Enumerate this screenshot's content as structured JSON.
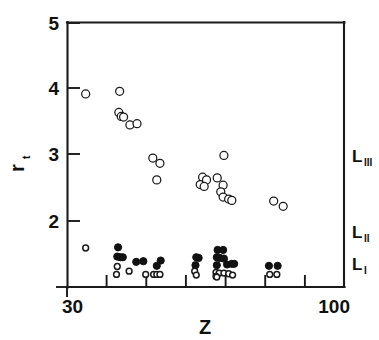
{
  "chart_data": {
    "type": "scatter",
    "title": "",
    "xlabel": "Z",
    "ylabel": "r t",
    "ylabel_base": "r",
    "ylabel_sub": "t",
    "xlim": [
      30,
      100
    ],
    "ylim": [
      1,
      5
    ],
    "grid": false,
    "legend_position": "right-inside",
    "x_tick_labels": [
      "30",
      "100"
    ],
    "x_tick_values": [
      30,
      100
    ],
    "x_minor_ticks": [
      40,
      50,
      60,
      70,
      80,
      90
    ],
    "y_tick_labels": [
      "5",
      "4",
      "3",
      "2",
      "1"
    ],
    "y_tick_values": [
      5,
      4,
      3,
      2,
      1
    ],
    "y_labeled_ticks": [
      "5",
      "4",
      "3",
      "2"
    ],
    "series": [
      {
        "name": "L III",
        "label_base": "L",
        "label_sub": "III",
        "marker": "open-circle",
        "marker_size": 4.0,
        "color": "#1a1a1a",
        "points": [
          [
            34.6,
            3.92
          ],
          [
            43.2,
            3.96
          ],
          [
            43.0,
            3.64
          ],
          [
            43.6,
            3.58
          ],
          [
            44.2,
            3.57
          ],
          [
            45.8,
            3.45
          ],
          [
            47.6,
            3.47
          ],
          [
            51.6,
            2.95
          ],
          [
            53.4,
            2.87
          ],
          [
            52.6,
            2.62
          ],
          [
            64.2,
            2.66
          ],
          [
            63.6,
            2.55
          ],
          [
            65.2,
            2.62
          ],
          [
            64.6,
            2.52
          ],
          [
            69.6,
            2.99
          ],
          [
            67.9,
            2.65
          ],
          [
            69.4,
            2.54
          ],
          [
            68.8,
            2.44
          ],
          [
            69.4,
            2.36
          ],
          [
            70.8,
            2.33
          ],
          [
            71.6,
            2.31
          ],
          [
            82.2,
            2.3
          ],
          [
            84.6,
            2.22
          ]
        ]
      },
      {
        "name": "L II",
        "label_base": "L",
        "label_sub": "II",
        "marker": "filled-circle",
        "marker_size": 3.6,
        "color": "#111111",
        "points": [
          [
            42.8,
            1.6
          ],
          [
            42.6,
            1.46
          ],
          [
            43.4,
            1.45
          ],
          [
            44.0,
            1.45
          ],
          [
            47.4,
            1.38
          ],
          [
            49.2,
            1.39
          ],
          [
            53.6,
            1.4
          ],
          [
            52.6,
            1.32
          ],
          [
            62.6,
            1.45
          ],
          [
            63.2,
            1.44
          ],
          [
            62.4,
            1.33
          ],
          [
            68.0,
            1.56
          ],
          [
            69.4,
            1.56
          ],
          [
            67.8,
            1.45
          ],
          [
            68.6,
            1.44
          ],
          [
            69.6,
            1.43
          ],
          [
            67.8,
            1.33
          ],
          [
            70.4,
            1.34
          ],
          [
            71.6,
            1.35
          ],
          [
            72.2,
            1.35
          ],
          [
            81.0,
            1.32
          ],
          [
            83.2,
            1.32
          ]
        ]
      },
      {
        "name": "L I",
        "label_base": "L",
        "label_sub": "I",
        "marker": "small-open-circle",
        "marker_size": 2.9,
        "color": "#1a1a1a",
        "points": [
          [
            34.6,
            1.59
          ],
          [
            42.6,
            1.31
          ],
          [
            42.4,
            1.19
          ],
          [
            45.6,
            1.24
          ],
          [
            49.8,
            1.19
          ],
          [
            51.8,
            1.19
          ],
          [
            52.6,
            1.19
          ],
          [
            53.4,
            1.19
          ],
          [
            62.2,
            1.24
          ],
          [
            62.6,
            1.18
          ],
          [
            67.6,
            1.22
          ],
          [
            68.4,
            1.21
          ],
          [
            67.6,
            1.16
          ],
          [
            67.8,
            1.15
          ],
          [
            69.6,
            1.21
          ],
          [
            70.8,
            1.2
          ],
          [
            71.8,
            1.18
          ],
          [
            81.2,
            1.19
          ],
          [
            83.0,
            1.19
          ]
        ]
      }
    ]
  },
  "figure": {
    "series_label_positions": [
      {
        "series": "L III",
        "x": 352,
        "y": 162
      },
      {
        "series": "L II",
        "x": 352,
        "y": 238
      },
      {
        "series": "L I",
        "x": 352,
        "y": 270
      }
    ]
  }
}
